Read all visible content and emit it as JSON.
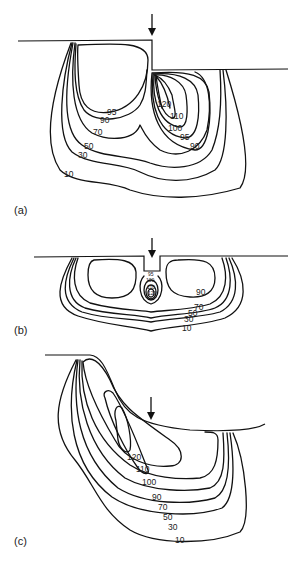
{
  "figure": {
    "panels": [
      {
        "id": "a",
        "label": "(a)",
        "contour_labels": [
          "120",
          "110",
          "100",
          "95",
          "90",
          "95",
          "90",
          "70",
          "50",
          "30",
          "10"
        ],
        "labels": {
          "l120": "120",
          "l110": "110",
          "l100": "100",
          "l95r": "95",
          "l90r": "90",
          "l95l": "95",
          "l90l": "90",
          "l70": "70",
          "l50": "50",
          "l30": "30",
          "l10": "10"
        }
      },
      {
        "id": "b",
        "label": "(b)",
        "labels": {
          "l95": "95",
          "l100": "100",
          "l110": "110",
          "l120": "120",
          "l90": "90",
          "l70": "70",
          "l50": "50",
          "l30": "30",
          "l10": "10"
        }
      },
      {
        "id": "c",
        "label": "(c)",
        "labels": {
          "l120": "120",
          "l110": "110",
          "l100": "100",
          "l90": "90",
          "l70": "70",
          "l50": "50",
          "l30": "30",
          "l10": "10"
        }
      }
    ]
  }
}
